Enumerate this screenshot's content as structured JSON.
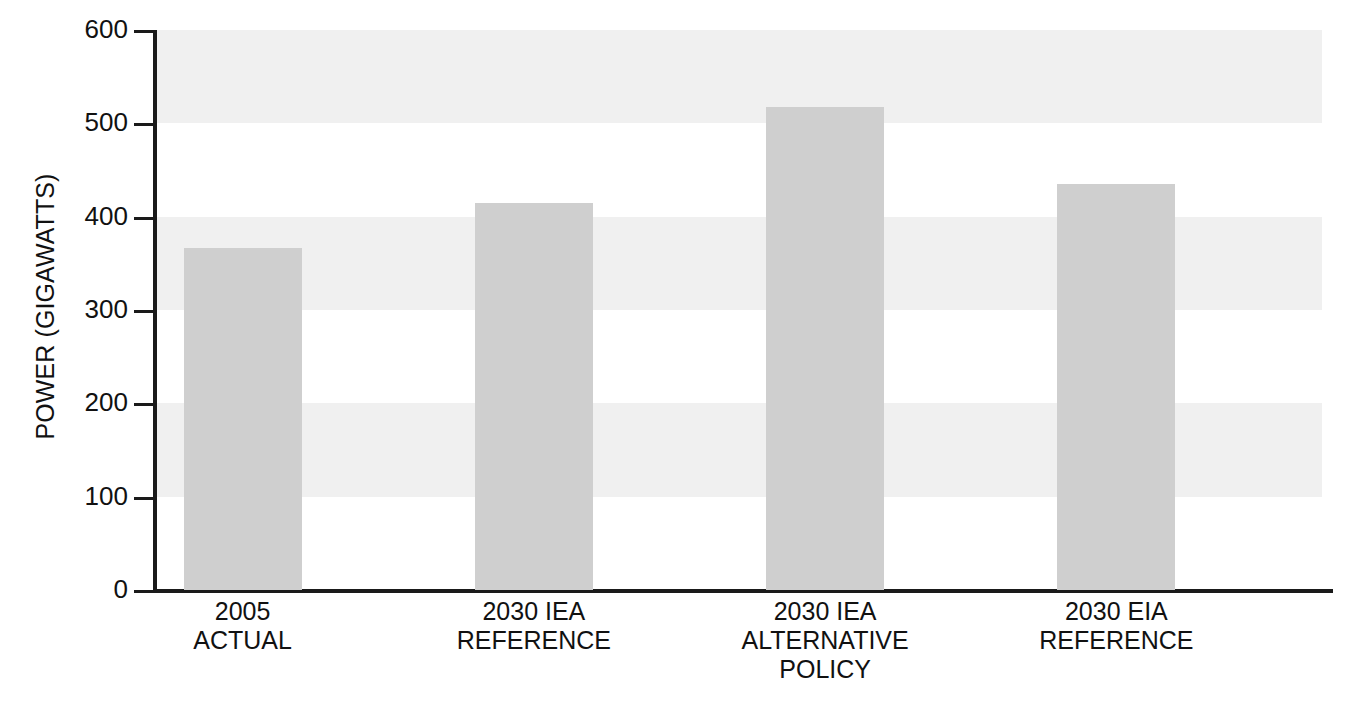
{
  "chart_data": {
    "type": "bar",
    "title": "",
    "xlabel": "",
    "ylabel": "POWER (GIGAWATTS)",
    "ylim": [
      0,
      600
    ],
    "yticks": [
      0,
      100,
      200,
      300,
      400,
      500,
      600
    ],
    "ytick_labels": [
      "0",
      "100",
      "200",
      "300",
      "400",
      "500",
      "600"
    ],
    "grid": false,
    "banded_background": true,
    "bands": [
      {
        "from": 100,
        "to": 200
      },
      {
        "from": 300,
        "to": 400
      },
      {
        "from": 500,
        "to": 600
      }
    ],
    "legend": null,
    "categories": [
      "2005\nACTUAL",
      "2030 IEA\nREFERENCE",
      "2030 IEA\nALTERNATIVE\nPOLICY",
      "2030 EIA\nREFERENCE"
    ],
    "category_lines": [
      [
        "2005",
        "ACTUAL"
      ],
      [
        "2030 IEA",
        "REFERENCE"
      ],
      [
        "2030 IEA",
        "ALTERNATIVE",
        "POLICY"
      ],
      [
        "2030 EIA",
        "REFERENCE"
      ]
    ],
    "values": [
      366,
      415,
      518,
      435
    ],
    "units": "gigawatts",
    "colors": {
      "bar_fill": "#cfcfcf",
      "band_fill": "#f0f0f0",
      "axis": "#1a1a1a",
      "text": "#111111",
      "background": "#ffffff"
    }
  }
}
